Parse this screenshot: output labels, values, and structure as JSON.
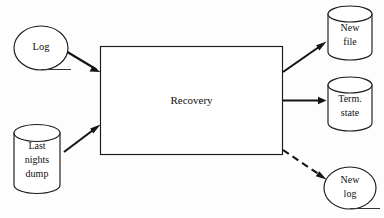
{
  "figure": {
    "background_color": "#fdfdfd",
    "line_color": "#141414",
    "text_color": "#101010",
    "width": 384,
    "height": 218
  },
  "process": {
    "label": "Recovery",
    "shape": "rectangle"
  },
  "inputs": [
    {
      "id": "log",
      "shape": "ellipse",
      "label": "Log",
      "lines": [
        "Log"
      ]
    },
    {
      "id": "last-nights-dump",
      "shape": "cylinder",
      "label": "Last nights dump",
      "lines": [
        "Last",
        "nights",
        "dump"
      ]
    }
  ],
  "outputs": [
    {
      "id": "new-file",
      "shape": "cylinder",
      "label": "New file",
      "lines": [
        "New",
        "file"
      ]
    },
    {
      "id": "term-state",
      "shape": "cylinder",
      "label": "Term. state",
      "lines": [
        "Term.",
        "state"
      ]
    },
    {
      "id": "new-log",
      "shape": "ellipse",
      "label": "New log",
      "lines": [
        "New",
        "log"
      ]
    }
  ],
  "connectors": [
    {
      "id": "log-to-recovery",
      "from": "log",
      "to": "recovery",
      "style": "solid",
      "arrow": "end"
    },
    {
      "id": "dump-to-recovery",
      "from": "last-nights-dump",
      "to": "recovery",
      "style": "solid",
      "arrow": "end"
    },
    {
      "id": "recovery-to-new-file",
      "from": "recovery",
      "to": "new-file",
      "style": "solid",
      "arrow": "end"
    },
    {
      "id": "recovery-to-term-state",
      "from": "recovery",
      "to": "term-state",
      "style": "solid",
      "arrow": "end"
    },
    {
      "id": "recovery-to-new-log",
      "from": "recovery",
      "to": "new-log",
      "style": "dashed",
      "arrow": "end"
    }
  ]
}
